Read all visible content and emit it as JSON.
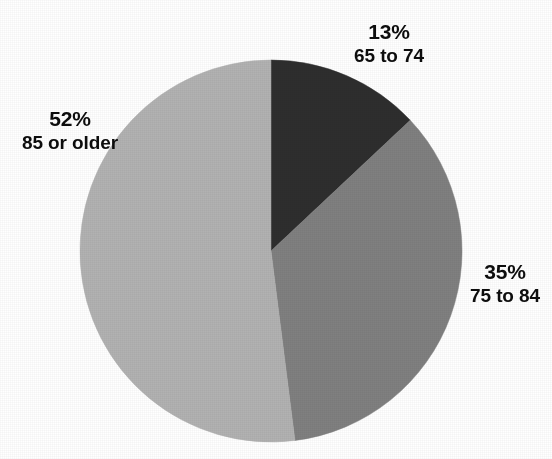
{
  "page": {
    "background_color": "#ffffff",
    "width": 552,
    "height": 459
  },
  "chart_data": {
    "type": "pie",
    "title": "",
    "subtitle": "",
    "xlabel": "",
    "ylabel": "",
    "legend_position": "none",
    "grid": false,
    "value_unit": "percent",
    "start_angle_deg": 0,
    "direction": "clockwise",
    "categories": [
      "65 to 74",
      "75 to 84",
      "85 or older"
    ],
    "values": [
      13,
      35,
      52
    ],
    "labels": [
      "13%",
      "35%",
      "52%"
    ],
    "colors": [
      "#2e2e2e",
      "#808080",
      "#b2b2b2"
    ],
    "slices": [
      {
        "category": "65 to 74",
        "value": 13,
        "percent_label": "13%",
        "color": "#2e2e2e",
        "start_angle_deg": 0,
        "end_angle_deg": 46.8,
        "label_position": "outside-top"
      },
      {
        "category": "75 to 84",
        "value": 35,
        "percent_label": "35%",
        "color": "#808080",
        "start_angle_deg": 46.8,
        "end_angle_deg": 172.8,
        "label_position": "outside-right"
      },
      {
        "category": "85 or older",
        "value": 52,
        "percent_label": "52%",
        "color": "#b2b2b2",
        "start_angle_deg": 172.8,
        "end_angle_deg": 360,
        "label_position": "outside-left"
      }
    ]
  },
  "geometry": {
    "center_x": 271,
    "center_y": 251,
    "radius": 191
  },
  "labels": {
    "top": {
      "percent": "13%",
      "category": "65 to 74"
    },
    "right": {
      "percent": "35%",
      "category": "75 to 84"
    },
    "left": {
      "percent": "52%",
      "category": "85 or older"
    }
  }
}
